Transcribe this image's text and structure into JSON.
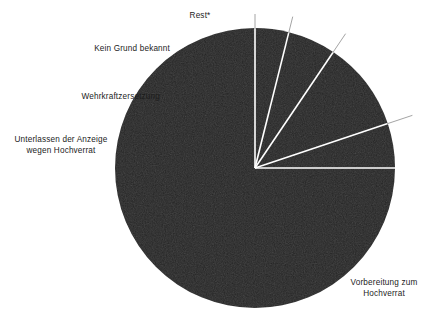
{
  "chart_data": {
    "type": "pie",
    "title": "",
    "subtitle": "",
    "xlabel": "",
    "ylabel": "",
    "legend_position": "none",
    "grid": false,
    "start_angle_deg": 90,
    "direction": "counterclockwise",
    "center": {
      "x": 255,
      "y": 168
    },
    "radius": 140,
    "slice_color": "#262626",
    "divider_color": "#ffffff",
    "background_color": "#ffffff",
    "label_color": "#1c1c1c",
    "categories": [
      "Vorbereitung zum\nHochverrat",
      "Rest*",
      "Kein Grund bekannt",
      "Wehrkraftzersetzung",
      "Unterlassen der Anzeige\nwegen Hochverrat"
    ],
    "values": [
      75.0,
      5.1,
      10.4,
      5.6,
      3.9
    ],
    "slices": [
      {
        "label": "Vorbereitung zum\nHochverrat",
        "value": 75.0,
        "start_deg": 0,
        "end_deg": 270,
        "color": "#262626"
      },
      {
        "label": "Rest*",
        "value": 5.1,
        "start_deg": 270,
        "end_deg": 288.5,
        "color": "#262626"
      },
      {
        "label": "Kein Grund bekannt",
        "value": 10.4,
        "start_deg": 288.5,
        "end_deg": 326,
        "color": "#262626"
      },
      {
        "label": "Wehrkraftzersetzung",
        "value": 5.6,
        "start_deg": 326,
        "end_deg": 346,
        "color": "#262626"
      },
      {
        "label": "Unterlassen der Anzeige\nwegen Hochverrat",
        "value": 3.9,
        "start_deg": 346,
        "end_deg": 360,
        "color": "#262626"
      }
    ]
  },
  "labels": {
    "rest": "Rest*",
    "kein_grund_bekannt": "Kein Grund bekannt",
    "wehrkraftzersetzung": "Wehrkraftzersetzung",
    "unterlassen_der_anzeige": "Unterlassen der Anzeige\nwegen Hochverrat",
    "vorbereitung_zum_hochverrat": "Vorbereitung zum\nHochverrat"
  }
}
